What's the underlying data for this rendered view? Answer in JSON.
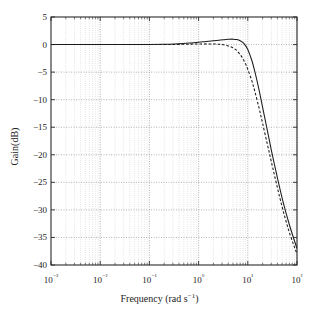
{
  "chart_data": {
    "type": "line",
    "title": "",
    "xlabel": "Frequency (rad s⁻¹)",
    "ylabel": "Gain(dB)",
    "xscale": "log",
    "yscale": "linear",
    "xlim": [
      0.001,
      100
    ],
    "ylim": [
      -40,
      5
    ],
    "grid": true,
    "grid_style": "dotted",
    "minor_grid": true,
    "legend": "none",
    "xticks": [
      "10⁻³",
      "10⁻²",
      "10⁻¹",
      "10⁰",
      "10¹",
      "10²"
    ],
    "xtick_values": [
      0.001,
      0.01,
      0.1,
      1,
      10,
      100
    ],
    "yticks": [
      "5",
      "0",
      "−5",
      "−10",
      "−15",
      "−20",
      "−25",
      "−30",
      "−35",
      "−40"
    ],
    "ytick_values": [
      5,
      0,
      -5,
      -10,
      -15,
      -20,
      -25,
      -30,
      -35,
      -40
    ],
    "series": [
      {
        "name": "solid",
        "style": "solid",
        "color": "#1b1b1b",
        "x": [
          0.001,
          0.0032,
          0.01,
          0.032,
          0.1,
          0.2,
          0.32,
          0.5,
          0.7,
          1.0,
          1.4,
          2.0,
          2.6,
          3.2,
          4.0,
          5.0,
          6.0,
          7.0,
          8.0,
          9.0,
          10.0,
          12.0,
          14.0,
          17.0,
          20.0,
          25.0,
          30.0,
          40.0,
          50.0,
          60.0,
          70.0,
          85.0,
          100.0
        ],
        "y": [
          0.0,
          0.0,
          0.0,
          0.0,
          0.02,
          0.05,
          0.1,
          0.2,
          0.3,
          0.4,
          0.55,
          0.7,
          0.8,
          0.88,
          0.95,
          0.98,
          0.9,
          0.7,
          0.35,
          -0.2,
          -0.9,
          -2.8,
          -5.0,
          -8.3,
          -11.4,
          -15.6,
          -19.1,
          -24.2,
          -27.9,
          -30.6,
          -32.7,
          -35.1,
          -37.0
        ]
      },
      {
        "name": "dashed",
        "style": "dashed",
        "color": "#1b1b1b",
        "x": [
          0.001,
          0.0032,
          0.01,
          0.032,
          0.1,
          0.2,
          0.32,
          0.5,
          0.7,
          1.0,
          1.4,
          2.0,
          2.6,
          3.2,
          4.0,
          5.0,
          6.0,
          7.0,
          8.0,
          9.0,
          10.0,
          12.0,
          14.0,
          17.0,
          20.0,
          25.0,
          30.0,
          40.0,
          50.0,
          60.0,
          70.0,
          85.0,
          100.0
        ],
        "y": [
          0.0,
          0.0,
          0.0,
          0.0,
          0.0,
          0.0,
          0.02,
          0.05,
          0.08,
          0.1,
          0.12,
          0.1,
          0.05,
          -0.05,
          -0.25,
          -0.6,
          -1.1,
          -1.8,
          -2.6,
          -3.5,
          -4.5,
          -6.5,
          -8.6,
          -11.6,
          -14.3,
          -18.1,
          -21.2,
          -26.0,
          -29.5,
          -32.1,
          -34.1,
          -36.3,
          -38.0
        ]
      }
    ]
  }
}
